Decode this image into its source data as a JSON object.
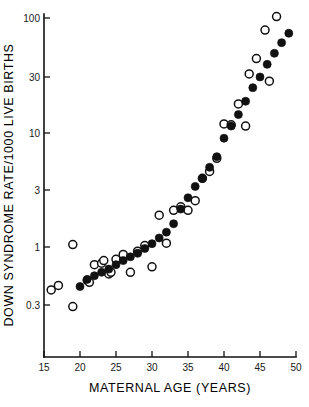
{
  "figure": {
    "background_color": "#ffffff",
    "ink_color": "#111111"
  },
  "axes": {
    "x_title": "MATERNAL AGE (YEARS)",
    "y_title": "DOWN SYNDROME RATE/1000 LIVE BIRTHS",
    "x_tick_labels": [
      "15",
      "20",
      "25",
      "30",
      "35",
      "40",
      "45",
      "50"
    ],
    "y_tick_labels": [
      "0.3",
      "1",
      "3",
      "10",
      "30",
      "100"
    ]
  },
  "chart_data": {
    "type": "scatter",
    "title": "",
    "subtitle": "",
    "xlabel": "MATERNAL AGE (YEARS)",
    "ylabel": "DOWN SYNDROME RATE/1000 LIVE BIRTHS",
    "xlim": [
      15,
      50
    ],
    "ylim": [
      0.2,
      130
    ],
    "yscale": "log",
    "xscale": "linear",
    "grid": false,
    "legend": "none",
    "x_ticks": [
      15,
      20,
      25,
      30,
      35,
      40,
      45,
      50
    ],
    "y_ticks": [
      0.3,
      1,
      3,
      10,
      30,
      100
    ],
    "series": [
      {
        "name": "filled-circles",
        "marker": "filled circle",
        "marker_fill": "#111111",
        "points": [
          {
            "x": 20,
            "y": 0.45
          },
          {
            "x": 21,
            "y": 0.52
          },
          {
            "x": 22,
            "y": 0.56
          },
          {
            "x": 23,
            "y": 0.6
          },
          {
            "x": 24,
            "y": 0.64
          },
          {
            "x": 25,
            "y": 0.7
          },
          {
            "x": 26,
            "y": 0.76
          },
          {
            "x": 27,
            "y": 0.82
          },
          {
            "x": 28,
            "y": 0.88
          },
          {
            "x": 29,
            "y": 0.97
          },
          {
            "x": 30,
            "y": 1.07
          },
          {
            "x": 31,
            "y": 1.2
          },
          {
            "x": 32,
            "y": 1.35
          },
          {
            "x": 33,
            "y": 1.6
          },
          {
            "x": 34,
            "y": 2.15
          },
          {
            "x": 35,
            "y": 2.7
          },
          {
            "x": 36,
            "y": 3.4
          },
          {
            "x": 37,
            "y": 4.0
          },
          {
            "x": 38,
            "y": 5.0
          },
          {
            "x": 39,
            "y": 6.2
          },
          {
            "x": 40,
            "y": 9.0
          },
          {
            "x": 41,
            "y": 11.5
          },
          {
            "x": 42,
            "y": 14.5
          },
          {
            "x": 43,
            "y": 19.0
          },
          {
            "x": 44,
            "y": 25.0
          },
          {
            "x": 45,
            "y": 31.0
          },
          {
            "x": 46,
            "y": 40.0
          },
          {
            "x": 47,
            "y": 50.0
          },
          {
            "x": 48,
            "y": 62.0
          },
          {
            "x": 49,
            "y": 75.0
          }
        ]
      },
      {
        "name": "open-circles",
        "marker": "open circle",
        "marker_fill": "#ffffff",
        "points": [
          {
            "x": 16,
            "y": 0.42
          },
          {
            "x": 17,
            "y": 0.46
          },
          {
            "x": 19,
            "y": 1.05
          },
          {
            "x": 19,
            "y": 0.3
          },
          {
            "x": 21,
            "y": 0.51
          },
          {
            "x": 21.3,
            "y": 0.49
          },
          {
            "x": 22,
            "y": 0.7
          },
          {
            "x": 23,
            "y": 0.72
          },
          {
            "x": 23.3,
            "y": 0.76
          },
          {
            "x": 24,
            "y": 0.58
          },
          {
            "x": 24.3,
            "y": 0.6
          },
          {
            "x": 25,
            "y": 0.78
          },
          {
            "x": 26,
            "y": 0.86
          },
          {
            "x": 27,
            "y": 0.6
          },
          {
            "x": 28,
            "y": 0.92
          },
          {
            "x": 29,
            "y": 1.03
          },
          {
            "x": 30,
            "y": 0.67
          },
          {
            "x": 31,
            "y": 1.9
          },
          {
            "x": 32,
            "y": 1.08
          },
          {
            "x": 33,
            "y": 2.1
          },
          {
            "x": 34,
            "y": 2.25
          },
          {
            "x": 35,
            "y": 2.1
          },
          {
            "x": 36,
            "y": 2.55
          },
          {
            "x": 37,
            "y": 4.0
          },
          {
            "x": 38,
            "y": 4.6
          },
          {
            "x": 39,
            "y": 6.0
          },
          {
            "x": 40,
            "y": 12.0
          },
          {
            "x": 41,
            "y": 11.8
          },
          {
            "x": 42,
            "y": 18.0
          },
          {
            "x": 43,
            "y": 11.5
          },
          {
            "x": 43.5,
            "y": 33.0
          },
          {
            "x": 44.5,
            "y": 45.0
          },
          {
            "x": 45.7,
            "y": 80.0
          },
          {
            "x": 46.3,
            "y": 28.5
          },
          {
            "x": 47.3,
            "y": 105.0
          }
        ]
      }
    ]
  }
}
